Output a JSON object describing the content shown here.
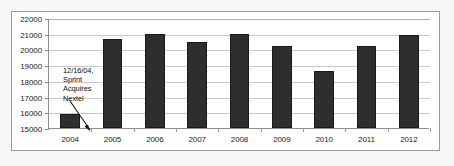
{
  "chart_data": {
    "type": "bar",
    "title": "",
    "subtitle": "",
    "xlabel": "",
    "ylabel": "",
    "categories": [
      "2004",
      "2005",
      "2006",
      "2007",
      "2008",
      "2009",
      "2010",
      "2011",
      "2012"
    ],
    "values": [
      15900,
      20650,
      20990,
      20450,
      20980,
      20250,
      18650,
      20200,
      20900
    ],
    "ylim": [
      15000,
      22000
    ],
    "ytick_labels": [
      "22000",
      "21000",
      "20000",
      "19000",
      "18000",
      "17000",
      "16000",
      "15000"
    ],
    "ytick_values": [
      22000,
      21000,
      20000,
      19000,
      18000,
      17000,
      16000,
      15000
    ],
    "grid": true,
    "legend": false,
    "legend_position": "none",
    "bar_color": "#2e2e2e",
    "gridline_color": "#c8c8c8",
    "axis_color": "#8d8d8d",
    "border_color": "#9a9a9a",
    "background_color": "#ffffff",
    "annotations": [
      {
        "target_category": "2004",
        "lines": [
          "12/16/04,",
          "Sprint",
          "Acquires",
          "Nextel"
        ],
        "text": "12/16/04, Sprint Acquires Nextel"
      }
    ]
  }
}
